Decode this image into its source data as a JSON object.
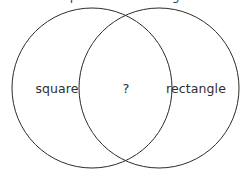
{
  "diagram": {
    "type": "venn",
    "kind": "two-circle-venn-diagram",
    "title_remnant": "square and rectangle",
    "background_color": "#ffffff",
    "stroke_color": "#2b2b2b",
    "stroke_width": 1,
    "text_color": "#2f2f2f",
    "canvas": {
      "width": 250,
      "height": 175
    },
    "circles": [
      {
        "id": "left",
        "name": "square-circle",
        "cx": 92,
        "cy": 88,
        "r": 80
      },
      {
        "id": "right",
        "name": "rectangle-circle",
        "cx": 159,
        "cy": 88,
        "r": 80
      }
    ],
    "intersection_points": [
      {
        "x": 125,
        "y": 18
      },
      {
        "x": 125,
        "y": 157
      }
    ],
    "regions": [
      {
        "id": "left_only",
        "name": "square-region",
        "label": "square",
        "x": 57,
        "y": 88
      },
      {
        "id": "intersection",
        "name": "intersection-region",
        "label": "?",
        "x": 126,
        "y": 88
      },
      {
        "id": "right_only",
        "name": "rectangle-region",
        "label": "rectangle",
        "x": 196,
        "y": 88
      }
    ]
  }
}
